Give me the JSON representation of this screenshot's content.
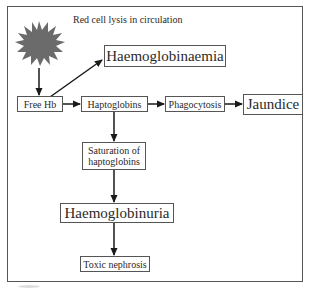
{
  "diagram": {
    "caption": "Red cell lysis in circulation",
    "nodes": {
      "lysis_burst": "starburst",
      "haemoglobinaemia": "Haemoglobinaemia",
      "free_hb": "Free Hb",
      "haptoglobins": "Haptoglobins",
      "phagocytosis": "Phagocytosis",
      "jaundice": "Jaundice",
      "saturation_line1": "Saturation of",
      "saturation_line2": "haptoglobins",
      "haemoglobinuria": "Haemoglobinuria",
      "toxic_nephrosis": "Toxic nephrosis"
    },
    "edges": [
      {
        "from": "lysis_burst",
        "to": "free_hb"
      },
      {
        "from": "free_hb",
        "to": "haemoglobinaemia"
      },
      {
        "from": "free_hb",
        "to": "haptoglobins"
      },
      {
        "from": "haptoglobins",
        "to": "phagocytosis"
      },
      {
        "from": "phagocytosis",
        "to": "jaundice"
      },
      {
        "from": "haptoglobins",
        "to": "saturation_of_haptoglobins"
      },
      {
        "from": "saturation_of_haptoglobins",
        "to": "haemoglobinuria"
      },
      {
        "from": "haemoglobinuria",
        "to": "toxic_nephrosis"
      }
    ],
    "colors": {
      "burst": "#6b6b6b",
      "line": "#1a1a1a",
      "border": "#555555"
    }
  }
}
